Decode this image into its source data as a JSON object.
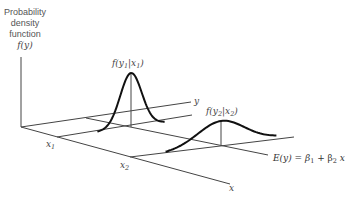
{
  "figure": {
    "y_axis_label_lines": [
      "Probability",
      "density",
      "function",
      "f(y)"
    ],
    "axis_y_label": "y",
    "axis_x_label": "x",
    "x_ticks": [
      {
        "name": "x1",
        "base": "x",
        "sub": "1"
      },
      {
        "name": "x2",
        "base": "x",
        "sub": "2"
      }
    ],
    "curve1_label": {
      "pre": "f(y",
      "sub1": "1",
      "mid": "|x",
      "sub2": "1",
      "post": ")"
    },
    "curve2_label": {
      "pre": "f(y",
      "sub1": "2",
      "mid": "|x",
      "sub2": "2",
      "post": ")"
    },
    "regression_label": {
      "pre": "E(y) = β",
      "sub1": "1",
      "mid": " + β",
      "sub2": "2",
      "post": " x"
    },
    "colors": {
      "axes": "#333333",
      "curves": "#111111",
      "text": "#555555"
    }
  }
}
